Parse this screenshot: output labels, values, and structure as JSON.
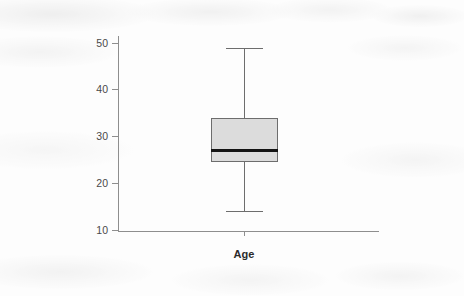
{
  "chart_data": {
    "type": "box",
    "title": "",
    "subtitle": "",
    "xlabel": "Age",
    "ylabel": "",
    "grid": false,
    "legend": null,
    "categories": [
      "Age"
    ],
    "ylim": [
      7,
      52
    ],
    "yticks": [
      10,
      20,
      30,
      40,
      50
    ],
    "ytick_labels": [
      "10",
      "20",
      "30",
      "40",
      "50"
    ],
    "xticks": [
      "Age"
    ],
    "boxes": [
      {
        "label": "Age",
        "whisker_low": 14,
        "q1": 24.5,
        "median": 27,
        "q3": 34,
        "whisker_high": 49,
        "outliers": [],
        "fill_color": "#dcdcdc",
        "line_color": "#6d6d6d",
        "median_color": "#141414"
      }
    ],
    "axis_color": "#8e8e8e",
    "background_color": "#fdfdfd"
  },
  "axes": {
    "y_tick_0": "10",
    "y_tick_1": "20",
    "y_tick_2": "30",
    "y_tick_3": "40",
    "y_tick_4": "50",
    "x_label": "Age"
  }
}
